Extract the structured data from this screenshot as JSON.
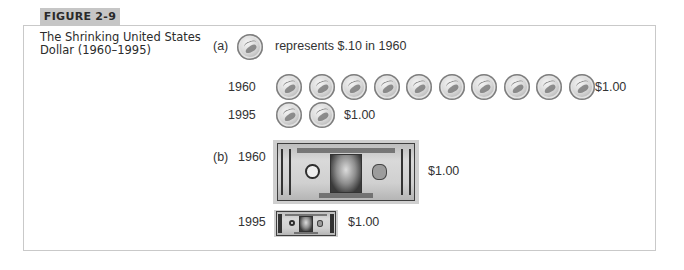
{
  "figure": {
    "label": "FIGURE 2-9",
    "caption": "The Shrinking United States Dollar (1960–1995)"
  },
  "part_a": {
    "marker": "(a)",
    "legend_icon": "dime-coin-icon",
    "legend_text": "represents $.10 in 1960",
    "rows": [
      {
        "year": "1960",
        "coins": 10,
        "value": "$1.00"
      },
      {
        "year": "1995",
        "coins": 2,
        "value": "$1.00"
      }
    ]
  },
  "part_b": {
    "marker": "(b)",
    "rows": [
      {
        "year": "1960",
        "icon": "dollar-bill-icon",
        "bill_text": "THE UNITED STATES OF AMERICA",
        "denomination": "ONE DOLLAR",
        "value": "$1.00"
      },
      {
        "year": "1995",
        "icon": "dollar-bill-icon",
        "value": "$1.00"
      }
    ]
  },
  "colors": {
    "frame_border": "#c9c9c9",
    "tab_background": "#c6c6c6",
    "text": "#333333"
  }
}
